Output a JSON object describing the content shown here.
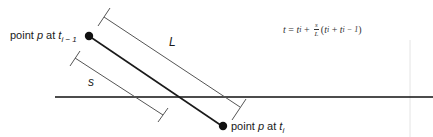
{
  "diagram": {
    "labels": {
      "start_point": {
        "prefix": "point ",
        "var": "p",
        "mid": " at ",
        "t": "t",
        "sub": "i − 1"
      },
      "end_point": {
        "prefix": "point ",
        "var": "p",
        "mid": " at ",
        "t": "t",
        "sub": "i"
      },
      "length_total": "L",
      "length_partial": "s"
    },
    "formula": {
      "lhs": "t",
      "eq": " = ",
      "t1": "t",
      "t1_sub": "i",
      "plus": " + ",
      "frac_num": "s",
      "frac_den": "L",
      "open": "(",
      "t2": "t",
      "t2_sub": "i",
      "plus2": " + ",
      "t3": "t",
      "t3_sub": "i − 1",
      "close": ")"
    },
    "colors": {
      "main_line": "#1a1a1a",
      "bracket": "#555555",
      "baseline": "#111111"
    }
  }
}
